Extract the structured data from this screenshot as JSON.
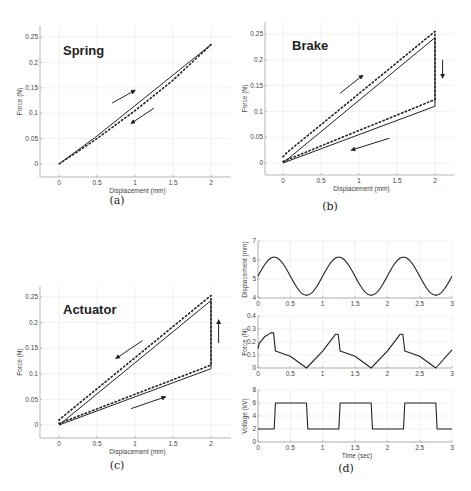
{
  "chart_data": [
    {
      "id": "a",
      "type": "line",
      "caption": "(a)",
      "title": "Spring",
      "xlabel": "Displacement (mm)",
      "ylabel": "Force (N)",
      "xlim": [
        -0.25,
        2.25
      ],
      "ylim": [
        -0.025,
        0.275
      ],
      "xticks": [
        "0",
        "0.5",
        "1",
        "1.5",
        "2"
      ],
      "yticks": [
        "0",
        "0.05",
        "0.1",
        "0.15",
        "0.2",
        "0.25"
      ],
      "grid": true,
      "series": [
        {
          "name": "measured (solid)",
          "style": "solid",
          "x": [
            0,
            0.5,
            1,
            1.5,
            2
          ],
          "y": [
            0,
            0.055,
            0.115,
            0.175,
            0.235
          ]
        },
        {
          "name": "model (dotted)",
          "style": "dotted",
          "x": [
            2,
            1.5,
            1,
            0.5,
            0
          ],
          "y": [
            0.235,
            0.165,
            0.105,
            0.05,
            0
          ]
        }
      ],
      "arrows": [
        {
          "from": [
            0.7,
            0.12
          ],
          "to": [
            1.0,
            0.145
          ]
        },
        {
          "from": [
            1.25,
            0.11
          ],
          "to": [
            0.95,
            0.08
          ]
        }
      ]
    },
    {
      "id": "b",
      "type": "line",
      "caption": "(b)",
      "title": "Brake",
      "xlabel": "Displacement (mm)",
      "ylabel": "Force (N)",
      "xlim": [
        -0.25,
        2.25
      ],
      "ylim": [
        -0.025,
        0.275
      ],
      "xticks": [
        "0",
        "0.5",
        "1",
        "1.5",
        "2"
      ],
      "yticks": [
        "0",
        "0.05",
        "0.1",
        "0.15",
        "0.2",
        "0.25"
      ],
      "grid": true,
      "series": [
        {
          "name": "measured (solid)",
          "style": "solid",
          "x": [
            0,
            2,
            2,
            0
          ],
          "y": [
            0,
            0.243,
            0.11,
            0
          ]
        },
        {
          "name": "model (dotted)",
          "style": "dotted",
          "x": [
            0,
            0.05,
            2,
            2,
            0
          ],
          "y": [
            0.012,
            0.02,
            0.255,
            0.123,
            0.003
          ]
        }
      ],
      "arrows": [
        {
          "from": [
            0.75,
            0.135
          ],
          "to": [
            1.05,
            0.17
          ]
        },
        {
          "from": [
            2.1,
            0.2
          ],
          "to": [
            2.1,
            0.165
          ]
        },
        {
          "from": [
            1.4,
            0.048
          ],
          "to": [
            0.9,
            0.025
          ]
        }
      ]
    },
    {
      "id": "c",
      "type": "line",
      "caption": "(c)",
      "title": "Actuator",
      "xlabel": "Displacement (mm)",
      "ylabel": "Force (N)",
      "xlim": [
        -0.25,
        2.25
      ],
      "ylim": [
        -0.025,
        0.275
      ],
      "xticks": [
        "0",
        "0.5",
        "1",
        "1.5",
        "2"
      ],
      "yticks": [
        "0",
        "0.05",
        "0.1",
        "0.15",
        "0.2",
        "0.25"
      ],
      "grid": true,
      "series": [
        {
          "name": "measured (solid)",
          "style": "solid",
          "x": [
            0,
            2,
            2,
            0
          ],
          "y": [
            0,
            0.11,
            0.243,
            0
          ]
        },
        {
          "name": "model (dotted)",
          "style": "dotted",
          "x": [
            0,
            2,
            2,
            0,
            0
          ],
          "y": [
            0.003,
            0.117,
            0.253,
            0.01,
            0.003
          ]
        }
      ],
      "arrows": [
        {
          "from": [
            1.1,
            0.165
          ],
          "to": [
            0.75,
            0.13
          ]
        },
        {
          "from": [
            2.1,
            0.16
          ],
          "to": [
            2.1,
            0.205
          ]
        },
        {
          "from": [
            0.95,
            0.032
          ],
          "to": [
            1.4,
            0.055
          ]
        }
      ]
    },
    {
      "id": "d1",
      "type": "line",
      "caption": "(d)",
      "title": "",
      "xlabel": "",
      "ylabel": "Displacement (mm)",
      "xlim": [
        0,
        3
      ],
      "ylim": [
        4,
        7
      ],
      "xticks": [
        "0",
        "0.5",
        "1",
        "1.5",
        "2",
        "2.5",
        "3"
      ],
      "yticks": [
        "4",
        "5",
        "6",
        "7"
      ],
      "grid": true,
      "series": [
        {
          "name": "displacement",
          "style": "solid",
          "function": "5.15 + 1.0*sin(2*pi*t)",
          "x_range": [
            0,
            3
          ]
        }
      ]
    },
    {
      "id": "d2",
      "type": "line",
      "title": "",
      "xlabel": "",
      "ylabel": "Force (N)",
      "xlim": [
        0,
        3
      ],
      "ylim": [
        0,
        0.4
      ],
      "xticks": [
        "0",
        "0.5",
        "1",
        "1.5",
        "2",
        "2.5",
        "3"
      ],
      "yticks": [
        "0",
        "0.1",
        "0.2",
        "0.3",
        "0.4"
      ],
      "grid": true,
      "series": [
        {
          "name": "force",
          "style": "solid",
          "x": [
            0,
            0.02,
            0.1,
            0.2,
            0.24,
            0.27,
            0.5,
            0.75,
            1.0,
            1.2,
            1.24,
            1.27,
            1.5,
            1.75,
            2.0,
            2.2,
            2.24,
            2.27,
            2.5,
            2.75,
            3.0
          ],
          "y": [
            0.15,
            0.19,
            0.24,
            0.27,
            0.27,
            0.13,
            0.09,
            0.0,
            0.13,
            0.26,
            0.26,
            0.13,
            0.09,
            0.0,
            0.13,
            0.26,
            0.26,
            0.13,
            0.09,
            0.0,
            0.14
          ]
        }
      ]
    },
    {
      "id": "d3",
      "type": "line",
      "title": "",
      "xlabel": "Time (sec)",
      "ylabel": "Voltage (kV)",
      "xlim": [
        0,
        3
      ],
      "ylim": [
        0,
        8
      ],
      "xticks": [
        "0",
        "0.5",
        "1",
        "1.5",
        "2",
        "2.5",
        "3"
      ],
      "yticks": [
        "0",
        "2",
        "4",
        "6",
        "8"
      ],
      "grid": true,
      "series": [
        {
          "name": "voltage",
          "style": "solid",
          "x": [
            0,
            0.25,
            0.27,
            0.75,
            0.77,
            1.25,
            1.27,
            1.75,
            1.77,
            2.25,
            2.27,
            2.75,
            2.77,
            3.0
          ],
          "y": [
            2,
            2,
            6,
            6,
            2,
            2,
            6,
            6,
            2,
            2,
            6,
            6,
            2,
            2
          ]
        }
      ]
    }
  ],
  "captions": {
    "a": "(a)",
    "b": "(b)",
    "c": "(c)",
    "d": "(d)"
  }
}
